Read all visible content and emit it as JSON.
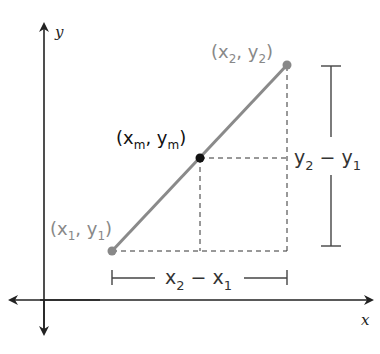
{
  "diagram": {
    "axes": {
      "x_label": "x",
      "y_label": "y"
    },
    "points": {
      "p1": {
        "label_open": "(",
        "x": "x",
        "x_sub": "1",
        "sep": ", ",
        "y": "y",
        "y_sub": "1",
        "label_close": ")",
        "color": "#888888"
      },
      "p2": {
        "label_open": "(",
        "x": "x",
        "x_sub": "2",
        "sep": ", ",
        "y": "y",
        "y_sub": "2",
        "label_close": ")",
        "color": "#888888"
      },
      "mid": {
        "label_open": "(",
        "x": "x",
        "x_sub": "m",
        "sep": ", ",
        "y": "y",
        "y_sub": "m",
        "label_close": ")",
        "color": "#111111"
      }
    },
    "dx_label": {
      "a": "x",
      "a_sub": "2",
      "op": " − ",
      "b": "x",
      "b_sub": "1"
    },
    "dy_label": {
      "a": "y",
      "a_sub": "2",
      "op": " − ",
      "b": "y",
      "b_sub": "1"
    },
    "colors": {
      "segment": "#8a8a8a",
      "axis": "#222222",
      "dashed": "#333333",
      "bracket": "#444444"
    }
  }
}
